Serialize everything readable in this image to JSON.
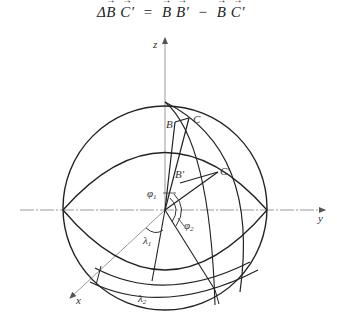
{
  "formula": {
    "lhs_delta": "Δ",
    "lhs_v1": "B",
    "lhs_v2": "C′",
    "eq": "=",
    "r1_v1": "B",
    "r1_v2": "B′",
    "minus": "−",
    "r2_v1": "B",
    "r2_v2": "C′"
  },
  "axes": {
    "z": "z",
    "y": "y",
    "x": "x"
  },
  "points": {
    "B": "B",
    "C": "C",
    "B_prime": "B′",
    "C_prime": "C′"
  },
  "angles": {
    "phi1": "φ",
    "phi1_sub": "1",
    "phi2": "φ",
    "phi2_sub": "2",
    "lambda1": "λ",
    "lambda1_sub": "1",
    "lambda2": "λ",
    "lambda2_sub": "2"
  },
  "colors": {
    "stroke": "#222222",
    "axis": "#888888"
  }
}
